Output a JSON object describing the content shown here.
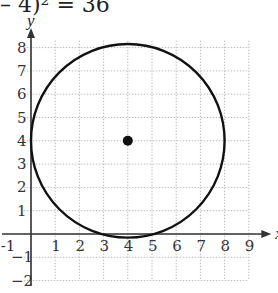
{
  "equation": "– 4)² = 36",
  "chart_data": {
    "type": "scatter",
    "xlabel": "x",
    "ylabel": "y",
    "xlim": [
      -1,
      9
    ],
    "ylim": [
      -2,
      8
    ],
    "x_ticks": [
      "-1",
      "1",
      "2",
      "3",
      "4",
      "5",
      "6",
      "7",
      "8",
      "9"
    ],
    "y_ticks": [
      "8",
      "7",
      "6",
      "5",
      "4",
      "3",
      "2",
      "1",
      "-1",
      "-2"
    ],
    "grid": true,
    "shapes": [
      {
        "type": "circle",
        "center": [
          4,
          4
        ],
        "radius": 4
      }
    ],
    "points": [
      {
        "x": 4,
        "y": 4,
        "label": "center"
      }
    ]
  },
  "colors": {
    "curve": "#111111",
    "grid": "#bdbdbd",
    "axis": "#333333"
  }
}
